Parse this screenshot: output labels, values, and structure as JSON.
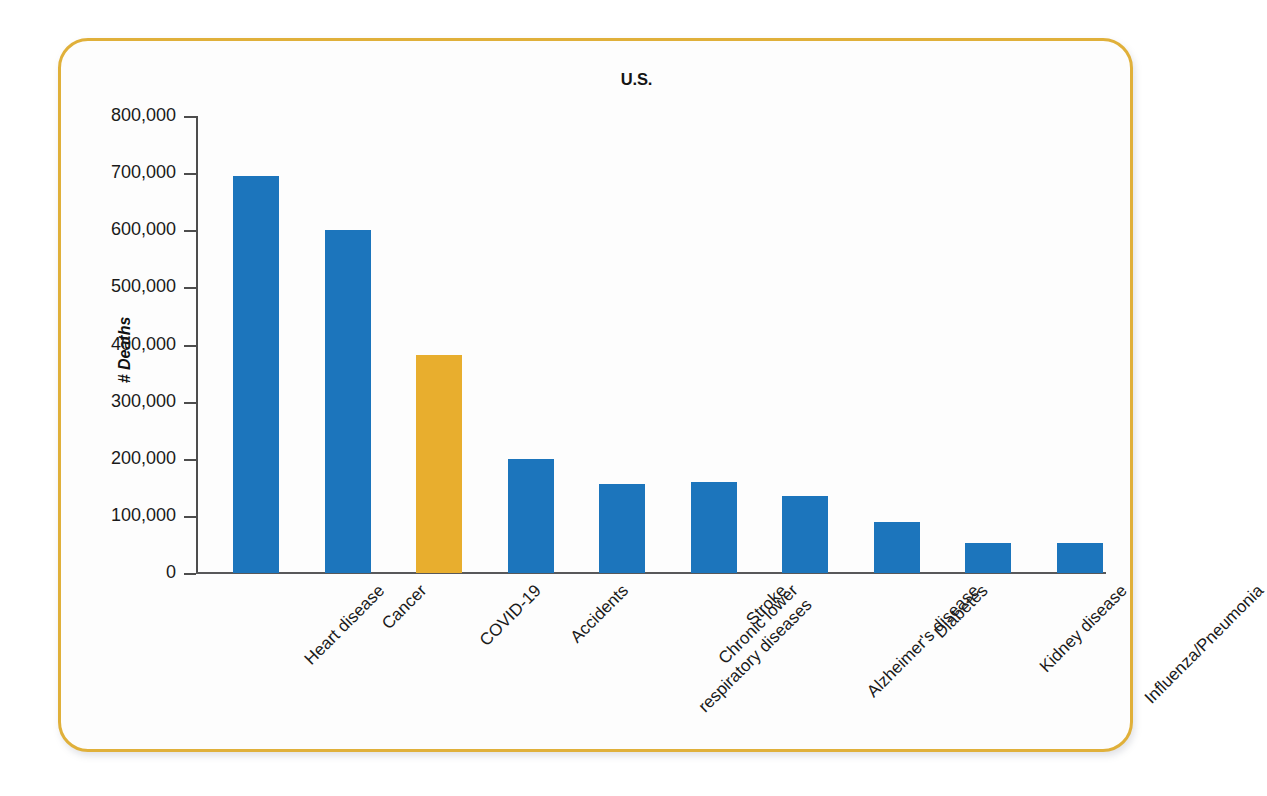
{
  "chart_data": {
    "type": "bar",
    "title": "U.S.",
    "xlabel": "",
    "ylabel": "# Deaths",
    "ylim": [
      0,
      800000
    ],
    "grid": false,
    "legend": "none",
    "y_ticks": [
      0,
      100000,
      200000,
      300000,
      400000,
      500000,
      600000,
      700000,
      800000
    ],
    "y_tick_labels": [
      "0",
      "100,000",
      "200,000",
      "300,000",
      "400,000",
      "500,000",
      "600,000",
      "700,000",
      "800,000"
    ],
    "categories": [
      "Heart disease",
      "Cancer",
      "COVID-19",
      "Accidents",
      "Chronic lower\nrespiratory diseases",
      "Stroke",
      "Alzheimer's disease",
      "Diabetes",
      "Kidney disease",
      "Influenza/Pneumonia"
    ],
    "values": [
      695000,
      601000,
      382000,
      200000,
      155000,
      160000,
      134000,
      90000,
      52000,
      53000
    ],
    "bar_colors": [
      "#1c75bc",
      "#1c75bc",
      "#e8ae2e",
      "#1c75bc",
      "#1c75bc",
      "#1c75bc",
      "#1c75bc",
      "#1c75bc",
      "#1c75bc",
      "#1c75bc"
    ],
    "highlight_category": "COVID-19",
    "series_color_default": "#1c75bc",
    "series_color_highlight": "#e8ae2e"
  },
  "frame": {
    "border_color": "#e0b03a",
    "background_color": "#fdfdfd"
  }
}
